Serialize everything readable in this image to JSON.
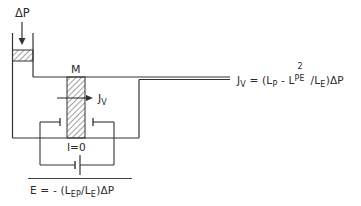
{
  "diagram": {
    "pressure_label": "ΔP",
    "membrane_label": "M",
    "flux_label": {
      "main": "J",
      "sub": "V"
    },
    "current_label": "I=0",
    "flux_equation": {
      "lhs_main": "J",
      "lhs_sub": "V",
      "eq": " = (L",
      "lp_sub": "P",
      "minus": " - L",
      "lpe_sup": "2",
      "lpe_sub": "PE",
      "slash": "/L",
      "le_sub": "E",
      "tail": ")ΔP"
    },
    "potential_equation": {
      "lhs": "E = - (L",
      "lep_sub": "EP",
      "slash": "/L",
      "le_sub": "E",
      "tail": ")ΔP"
    },
    "colors": {
      "line": "#333333",
      "hatch": "#444444"
    }
  }
}
